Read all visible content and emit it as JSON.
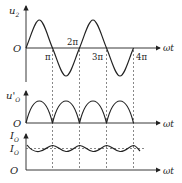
{
  "diagram": {
    "colors": {
      "stroke": "#222222",
      "dash": "#555555",
      "background": "#ffffff"
    },
    "top_plot": {
      "y_label": "u",
      "y_label_sub": "2",
      "origin_label": "O",
      "x_label": "ωt",
      "ticks": [
        "π",
        "2π",
        "3π",
        "4π"
      ]
    },
    "middle_plot": {
      "y_label": "u'",
      "y_label_sub": "O",
      "origin_label": "O",
      "x_label": "ωt"
    },
    "bottom_plot": {
      "y_label": "I",
      "y_label_sub": "O",
      "level_label": "I",
      "level_label_sub": "O",
      "origin_label": "O",
      "x_label": "ωt"
    }
  }
}
